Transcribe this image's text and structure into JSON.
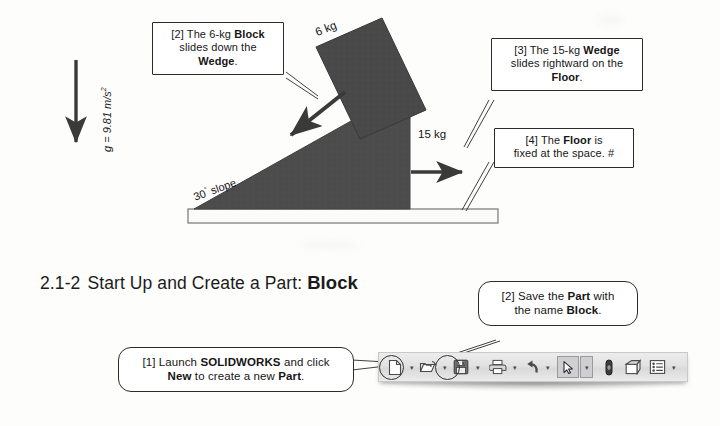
{
  "figure": {
    "gravity_label": "g = 9.81 m/s",
    "gravity_exponent": "2",
    "block_mass_label": "6 kg",
    "wedge_mass_label": "15 kg",
    "slope_label": "30",
    "slope_label_sup": "°",
    "slope_label_rest": " slope",
    "callouts": [
      {
        "id": "callout-2",
        "line1_pre": "[2] The 6-kg ",
        "line1_bold": "Block",
        "line2": "slides down the",
        "line3_bold": "Wedge",
        "line3_post": "."
      },
      {
        "id": "callout-3",
        "line1_pre": "[3] The 15-kg ",
        "line1_bold": "Wedge",
        "line2": "slides rightward on the",
        "line3_bold": "Floor",
        "line3_post": "."
      },
      {
        "id": "callout-4",
        "line1_pre": "[4] The ",
        "line1_bold": "Floor",
        "line1_post": " is",
        "line2": "fixed at the space. #"
      }
    ]
  },
  "section": {
    "number": "2.1-2",
    "title": "Start Up and Create a Part:",
    "title_bold": "Block"
  },
  "steps": [
    {
      "id": "callout-1",
      "line1_pre": "[1] Launch ",
      "line1_bold": "SOLIDWORKS",
      "line1_post": " and click",
      "line2_bold_a": "New",
      "line2_mid": " to create a new ",
      "line2_bold_b": "Part",
      "line2_post": "."
    },
    {
      "id": "callout-save",
      "line1_pre": "[2] Save the ",
      "line1_bold": "Part",
      "line1_post": " with",
      "line2_pre": "the name ",
      "line2_bold": "Block",
      "line2_post": "."
    }
  ],
  "toolbar": {
    "buttons": [
      {
        "name": "new-document-icon",
        "label": "New",
        "has_caret": true,
        "circled": true
      },
      {
        "name": "open-folder-icon",
        "label": "Open",
        "has_caret": true,
        "circled": false
      },
      {
        "name": "save-floppy-icon",
        "label": "Save",
        "has_caret": true,
        "circled": true
      },
      {
        "name": "print-icon",
        "label": "Print",
        "has_caret": true,
        "circled": false
      },
      {
        "name": "undo-icon",
        "label": "Undo",
        "has_caret": true,
        "circled": false
      },
      {
        "name": "select-arrow-icon",
        "label": "Select",
        "has_caret": true,
        "circled": false
      },
      {
        "name": "measure-icon",
        "label": "Measure",
        "has_caret": false,
        "circled": false
      },
      {
        "name": "appearance-icon",
        "label": "Appearance",
        "has_caret": false,
        "circled": false
      },
      {
        "name": "options-icon",
        "label": "Options",
        "has_caret": true,
        "circled": false
      }
    ],
    "caret_glyph": "▾"
  },
  "colors": {
    "wedge_fill": "#4a4a4a",
    "block_fill": "#474747",
    "floor_fill": "#fbfbfa",
    "outline": "#2b2b2b",
    "arrow": "#3a3a3a"
  }
}
